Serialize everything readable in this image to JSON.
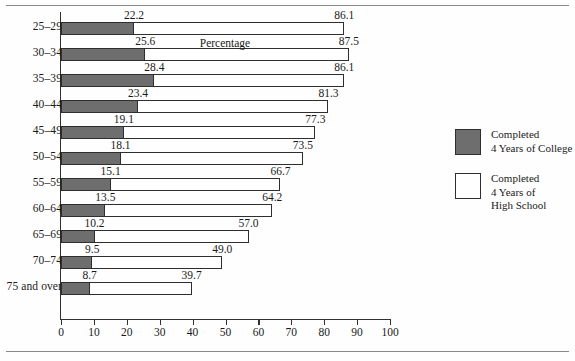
{
  "figure": {
    "xaxis_title": "Percentage"
  },
  "legend": {
    "items": [
      {
        "swatch": "filled-square-swatch",
        "label": "Completed\n4 Years of College"
      },
      {
        "swatch": "hollow-square-swatch",
        "label": "Completed\n4 Years of\nHigh School"
      }
    ]
  },
  "chart_data": {
    "type": "bar",
    "orientation": "horizontal",
    "title": "",
    "subtitle": "",
    "xlabel": "Percentage",
    "ylabel": "",
    "xlim": [
      0,
      100
    ],
    "xticks": [
      0,
      10,
      20,
      30,
      40,
      50,
      60,
      70,
      80,
      90,
      100
    ],
    "xtick_labels": [
      "0",
      "10",
      "20",
      "30",
      "40",
      "50",
      "60",
      "70",
      "80",
      "90",
      "100"
    ],
    "grid": false,
    "legend_position": "right",
    "categories": [
      "25–29",
      "30–34",
      "35–39",
      "40–44",
      "45–49",
      "50–54",
      "55–59",
      "60–64",
      "65–69",
      "70–74",
      "75 and over"
    ],
    "series": [
      {
        "name": "Completed 4 Years of College",
        "color": "#6e6e6e",
        "values": [
          22.2,
          25.6,
          28.4,
          23.4,
          19.1,
          18.1,
          15.1,
          13.5,
          10.2,
          9.5,
          8.7
        ],
        "labels": [
          "22.2",
          "25.6",
          "28.4",
          "23.4",
          "19.1",
          "18.1",
          "15.1",
          "13.5",
          "10.2",
          "9.5",
          "8.7"
        ]
      },
      {
        "name": "Completed 4 Years of High School",
        "color": "#ffffff",
        "values": [
          86.1,
          87.5,
          86.1,
          81.3,
          77.3,
          73.5,
          66.7,
          64.2,
          57.0,
          49.0,
          39.7
        ],
        "labels": [
          "86.1",
          "87.5",
          "86.1",
          "81.3",
          "77.3",
          "73.5",
          "66.7",
          "64.2",
          "57.0",
          "49.0",
          "39.7"
        ]
      }
    ]
  }
}
